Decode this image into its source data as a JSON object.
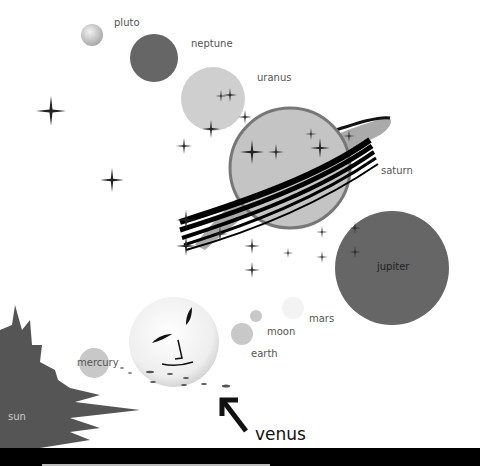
{
  "illustration": {
    "subject": "solar system",
    "labels": {
      "pluto": "pluto",
      "neptune": "neptune",
      "uranus": "uranus",
      "saturn": "saturn",
      "jupiter": "jupiter",
      "mars": "mars",
      "moon": "moon",
      "earth": "earth",
      "mercury": "mercury",
      "sun": "sun",
      "venus": "venus"
    },
    "colors": {
      "dark_planet": "#666666",
      "light_planet": "#c8c8c8",
      "outline": "#777777",
      "sun": "#555555",
      "text": "#555555",
      "bar": "#000000"
    }
  }
}
